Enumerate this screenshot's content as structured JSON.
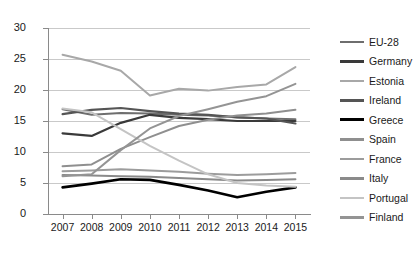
{
  "chart_data": {
    "type": "line",
    "title": "",
    "xlabel": "",
    "ylabel": "",
    "x": [
      "2007",
      "2008",
      "2009",
      "2010",
      "2011",
      "2012",
      "2013",
      "2014",
      "2015"
    ],
    "ylim": [
      0,
      30
    ],
    "yticks": [
      0,
      5,
      10,
      15,
      20,
      25,
      30
    ],
    "grid": true,
    "legend_position": "right",
    "series": [
      {
        "name": "EU-28",
        "color": "#6e6e6e",
        "width": 2.0,
        "values": [
          16.9,
          16.0,
          16.3,
          16.2,
          16.0,
          15.9,
          15.6,
          15.4,
          15.3
        ]
      },
      {
        "name": "Germany",
        "color": "#3a3a3a",
        "width": 2.2,
        "values": [
          13.0,
          12.6,
          14.7,
          16.0,
          15.5,
          15.3,
          15.0,
          15.0,
          15.0
        ]
      },
      {
        "name": "Estonia",
        "color": "#a8a8a8",
        "width": 2.0,
        "values": [
          25.7,
          24.6,
          23.1,
          19.1,
          20.2,
          19.9,
          20.5,
          20.9,
          23.7
        ]
      },
      {
        "name": "Ireland",
        "color": "#555555",
        "width": 2.2,
        "values": [
          16.1,
          16.8,
          17.1,
          16.6,
          16.2,
          16.0,
          15.6,
          15.4,
          14.6
        ]
      },
      {
        "name": "Greece",
        "color": "#000000",
        "width": 2.6,
        "values": [
          4.3,
          4.9,
          5.6,
          5.5,
          4.7,
          3.8,
          2.7,
          3.6,
          4.3
        ]
      },
      {
        "name": "Spain",
        "color": "#8f8f8f",
        "width": 2.0,
        "values": [
          7.7,
          8.0,
          10.5,
          12.4,
          14.2,
          15.2,
          15.9,
          16.2,
          16.8
        ]
      },
      {
        "name": "France",
        "color": "#9c9c9c",
        "width": 2.0,
        "values": [
          6.9,
          7.0,
          7.2,
          7.0,
          6.8,
          6.5,
          6.3,
          6.4,
          6.6
        ]
      },
      {
        "name": "Italy",
        "color": "#8a8a8a",
        "width": 2.0,
        "values": [
          6.3,
          6.2,
          6.1,
          6.0,
          5.8,
          5.6,
          5.4,
          5.5,
          5.6
        ]
      },
      {
        "name": "Portugal",
        "color": "#c4c4c4",
        "width": 2.0,
        "values": [
          17.0,
          16.4,
          13.7,
          11.0,
          8.6,
          6.4,
          5.0,
          4.6,
          4.4
        ]
      },
      {
        "name": "Finland",
        "color": "#949494",
        "width": 2.0,
        "values": [
          6.1,
          6.4,
          10.3,
          13.8,
          15.8,
          16.9,
          18.1,
          19.0,
          21.0
        ]
      }
    ]
  }
}
